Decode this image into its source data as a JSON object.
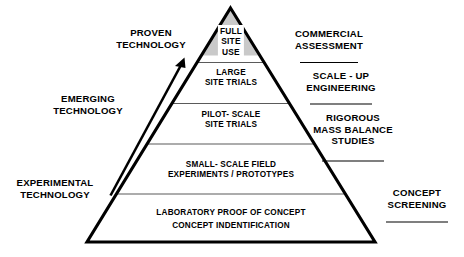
{
  "diagram": {
    "pyramid": {
      "tiers": [
        {
          "id": "full-site-use",
          "text": "FULL\nSITE\nUSE",
          "shaded": true
        },
        {
          "id": "large-site-trials",
          "text": "LARGE\nSITE TRIALS",
          "shaded": false
        },
        {
          "id": "pilot-scale-site-trials",
          "text": "PILOT- SCALE\nSITE TRIALS",
          "shaded": false
        },
        {
          "id": "small-scale-field",
          "text": "SMALL- SCALE FIELD\nEXPERIMENTS / PROTOTYPES",
          "shaded": false
        },
        {
          "id": "laboratory-proof",
          "text": "LABORATORY PROOF OF CONCEPT\nCONCEPT INDENTIFICATION",
          "shaded": false
        }
      ]
    },
    "left_labels": [
      {
        "id": "proven-technology",
        "text": "PROVEN\nTECHNOLOGY"
      },
      {
        "id": "emerging-technology",
        "text": "EMERGING\nTECHNOLOGY"
      },
      {
        "id": "experimental-technology",
        "text": "EXPERIMENTAL\nTECHNOLOGY"
      }
    ],
    "right_labels": [
      {
        "id": "commercial-assessment",
        "text": "COMMERCIAL\nASSESSMENT"
      },
      {
        "id": "scale-up-engineering",
        "text": "SCALE - UP\nENGINEERING"
      },
      {
        "id": "rigorous-mass-balance",
        "text": "RIGOROUS\nMASS BALANCE\nSTUDIES"
      },
      {
        "id": "concept-screening",
        "text": "CONCEPT\nSCREENING"
      }
    ],
    "colors": {
      "outline": "#000000",
      "divider": "#5a5a5a",
      "apex_shade": "#c9c9c9",
      "background": "#ffffff",
      "text": "#000000"
    }
  }
}
